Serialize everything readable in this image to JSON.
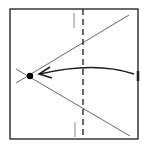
{
  "diagram": {
    "title": "Origami fold step",
    "colors": {
      "line": "#1a1a1a",
      "crease": "#555555",
      "background": "#ffffff",
      "dot": "#000000"
    },
    "square": {
      "x": 10,
      "y": 9,
      "w": 128,
      "h": 130
    },
    "fold_line_x": 83,
    "reference_mark_x": 74,
    "dot": {
      "x": 30,
      "y": 76
    },
    "arrow_label": "fold right edge to point"
  }
}
